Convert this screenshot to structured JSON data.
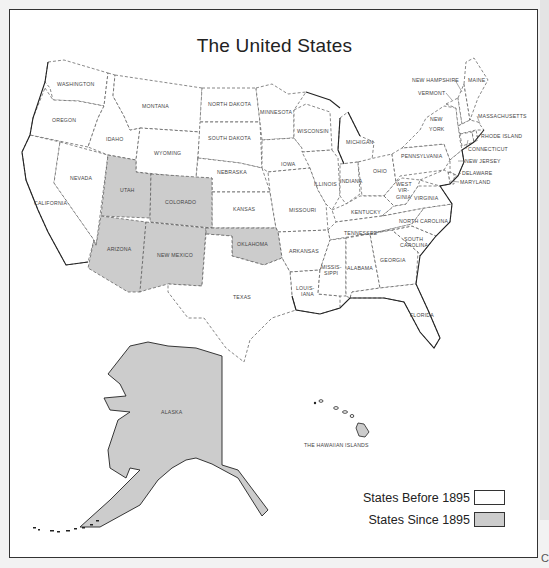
{
  "title": "The United States",
  "colors": {
    "states_before_1895": "#ffffff",
    "states_since_1895": "#cccccc",
    "border": "#333333",
    "label_text": "#444444"
  },
  "states": {
    "washington": "WASHINGTON",
    "oregon": "OREGON",
    "california": "CALIFORNIA",
    "nevada": "NEVADA",
    "idaho": "IDAHO",
    "montana": "MONTANA",
    "wyoming": "WYOMING",
    "utah": "UTAH",
    "colorado": "COLORADO",
    "arizona": "ARIZONA",
    "new_mexico": "NEW MEXICO",
    "north_dakota": "NORTH DAKOTA",
    "south_dakota": "SOUTH DAKOTA",
    "nebraska": "NEBRASKA",
    "kansas": "KANSAS",
    "oklahoma": "OKLAHOMA",
    "texas": "TEXAS",
    "minnesota": "MINNESOTA",
    "iowa": "IOWA",
    "missouri": "MISSOURI",
    "arkansas": "ARKANSAS",
    "louisiana_1": "LOUIS-",
    "louisiana_2": "IANA",
    "wisconsin": "WISCONSIN",
    "illinois": "ILLINOIS",
    "michigan": "MICHIGAN",
    "indiana": "INDIANA",
    "ohio": "OHIO",
    "kentucky": "KENTUCKY",
    "tennessee": "TENNESSEE",
    "mississippi_1": "MISSIS-",
    "mississippi_2": "SIPPI",
    "alabama": "ALABAMA",
    "georgia": "GEORGIA",
    "florida": "FLORIDA",
    "south_carolina_1": "SOUTH",
    "south_carolina_2": "CAROLINA",
    "north_carolina": "NORTH CAROLINA",
    "virginia": "VIRGINIA",
    "west_virginia_1": "WEST",
    "west_virginia_2": "VIR-",
    "west_virginia_3": "GINIA",
    "pennsylvania": "PENNSYLVANIA",
    "new_york_1": "NEW",
    "new_york_2": "YORK",
    "vermont": "VERMONT",
    "new_hampshire": "NEW HAMPSHIRE",
    "maine": "MAINE",
    "massachusetts": "MASSACHUSETTS",
    "rhode_island": "RHODE ISLAND",
    "connecticut": "CONNECTICUT",
    "new_jersey": "NEW JERSEY",
    "delaware": "DELAWARE",
    "maryland": "MARYLAND",
    "alaska": "ALASKA",
    "hawaii": "THE HAWAIIAN ISLANDS"
  },
  "legend": {
    "before": "States Before 1895",
    "since": "States Since 1895"
  },
  "corner_mark": "C"
}
